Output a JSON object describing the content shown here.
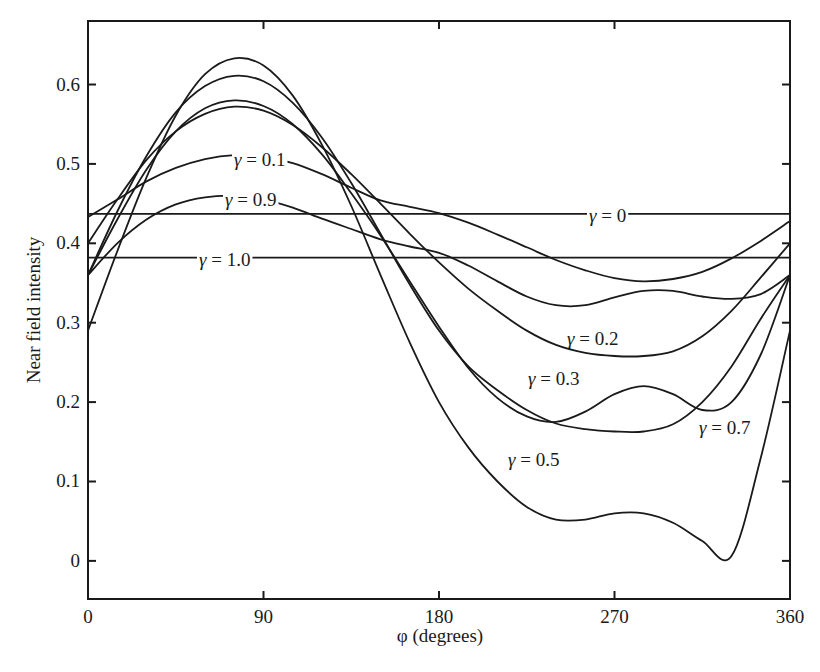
{
  "chart_data": {
    "type": "line",
    "title": "",
    "xlabel": "φ (degrees)",
    "ylabel": "Near field intensity",
    "xlim": [
      0,
      360
    ],
    "ylim": [
      -0.048,
      0.68
    ],
    "x_ticks": [
      0,
      90,
      180,
      270,
      360
    ],
    "x_tick_labels": [
      "0",
      "90",
      "180",
      "270",
      "360"
    ],
    "y_ticks": [
      0,
      0.1,
      0.2,
      0.3,
      0.4,
      0.5,
      0.6
    ],
    "y_tick_labels": [
      "0",
      "0.1",
      "0.2",
      "0.3",
      "0.4",
      "0.5",
      "0.6"
    ],
    "grid": false,
    "legend": "inline labels",
    "line_color": "#1a1a1a",
    "x": [
      0,
      15,
      30,
      45,
      60,
      75,
      90,
      105,
      120,
      135,
      150,
      165,
      180,
      195,
      210,
      225,
      240,
      255,
      270,
      285,
      300,
      315,
      330,
      345,
      360
    ],
    "series": [
      {
        "name": "γ = 0",
        "label": "γ = 0",
        "values": [
          0.437,
          0.437,
          0.437,
          0.437,
          0.437,
          0.437,
          0.437,
          0.437,
          0.437,
          0.437,
          0.437,
          0.437,
          0.437,
          0.437,
          0.437,
          0.437,
          0.437,
          0.437,
          0.437,
          0.437,
          0.437,
          0.437,
          0.437,
          0.437,
          0.437
        ]
      },
      {
        "name": "γ = 0.1",
        "label": "γ = 0.1",
        "values": [
          0.433,
          0.455,
          0.478,
          0.495,
          0.506,
          0.511,
          0.509,
          0.501,
          0.487,
          0.47,
          0.454,
          0.446,
          0.438,
          0.426,
          0.411,
          0.395,
          0.379,
          0.366,
          0.356,
          0.352,
          0.355,
          0.364,
          0.381,
          0.403,
          0.428
        ]
      },
      {
        "name": "γ = 0.2",
        "label": "γ = 0.2",
        "values": [
          0.4,
          0.455,
          0.505,
          0.541,
          0.563,
          0.572,
          0.567,
          0.549,
          0.521,
          0.487,
          0.45,
          0.412,
          0.376,
          0.343,
          0.315,
          0.29,
          0.272,
          0.262,
          0.258,
          0.258,
          0.264,
          0.283,
          0.315,
          0.357,
          0.4
        ]
      },
      {
        "name": "γ = 0.3",
        "label": "γ = 0.3",
        "values": [
          0.36,
          0.43,
          0.493,
          0.541,
          0.57,
          0.58,
          0.573,
          0.55,
          0.512,
          0.463,
          0.41,
          0.352,
          0.295,
          0.243,
          0.205,
          0.182,
          0.175,
          0.188,
          0.21,
          0.22,
          0.21,
          0.19,
          0.2,
          0.26,
          0.36
        ]
      },
      {
        "name": "γ = 0.5",
        "label": "γ = 0.5",
        "values": [
          0.29,
          0.39,
          0.483,
          0.561,
          0.613,
          0.633,
          0.624,
          0.586,
          0.524,
          0.447,
          0.36,
          0.275,
          0.2,
          0.143,
          0.1,
          0.068,
          0.052,
          0.052,
          0.06,
          0.06,
          0.048,
          0.025,
          0.006,
          0.13,
          0.29
        ]
      },
      {
        "name": "γ = 0.7",
        "label": "γ = 0.7",
        "values": [
          0.36,
          0.44,
          0.51,
          0.565,
          0.598,
          0.611,
          0.604,
          0.577,
          0.533,
          0.476,
          0.412,
          0.348,
          0.29,
          0.245,
          0.215,
          0.19,
          0.173,
          0.166,
          0.163,
          0.163,
          0.172,
          0.2,
          0.245,
          0.305,
          0.36
        ]
      },
      {
        "name": "γ = 0.9",
        "label": "γ = 0.9",
        "values": [
          0.36,
          0.4,
          0.43,
          0.449,
          0.458,
          0.46,
          0.455,
          0.445,
          0.431,
          0.418,
          0.405,
          0.396,
          0.388,
          0.372,
          0.352,
          0.333,
          0.322,
          0.322,
          0.332,
          0.34,
          0.34,
          0.333,
          0.33,
          0.336,
          0.36
        ]
      },
      {
        "name": "γ = 1.0",
        "label": "γ = 1.0",
        "values": [
          0.382,
          0.382,
          0.382,
          0.382,
          0.382,
          0.382,
          0.382,
          0.382,
          0.382,
          0.382,
          0.382,
          0.382,
          0.382,
          0.382,
          0.382,
          0.382,
          0.382,
          0.382,
          0.382,
          0.382,
          0.382,
          0.382,
          0.382,
          0.382,
          0.382
        ]
      }
    ],
    "annotations": [
      {
        "text": "γ = 0.1",
        "x_px": 234,
        "y_px": 166
      },
      {
        "text": "γ = 0.9",
        "x_px": 225,
        "y_px": 206
      },
      {
        "text": "γ = 0",
        "x_px": 589,
        "y_px": 222
      },
      {
        "text": "γ = 1.0",
        "x_px": 199,
        "y_px": 266
      },
      {
        "text": "γ = 0.2",
        "x_px": 567,
        "y_px": 345
      },
      {
        "text": "γ = 0.3",
        "x_px": 528,
        "y_px": 385
      },
      {
        "text": "γ = 0.7",
        "x_px": 699,
        "y_px": 434
      },
      {
        "text": "γ = 0.5",
        "x_px": 508,
        "y_px": 466
      }
    ]
  },
  "plot_area": {
    "left": 88,
    "right": 790,
    "top": 21,
    "bottom": 599
  }
}
